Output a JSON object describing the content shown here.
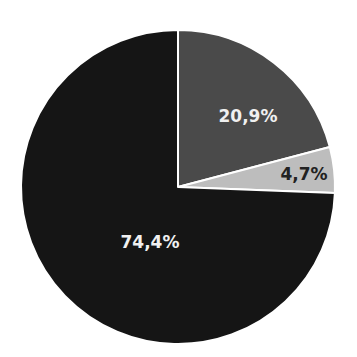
{
  "chart_data": {
    "type": "pie",
    "title": "",
    "categories": [
      "Slice A",
      "Slice B",
      "Slice C"
    ],
    "values": [
      20.9,
      4.7,
      74.4
    ],
    "labels": [
      "20,9%",
      "4,7%",
      "74,4%"
    ],
    "colors": [
      "#4a4a4a",
      "#bdbdbd",
      "#151515"
    ],
    "label_colors": [
      "#f0f0f0",
      "#222222",
      "#f0f0f0"
    ],
    "start_angle": "12 o'clock, clockwise",
    "legend": "none"
  }
}
